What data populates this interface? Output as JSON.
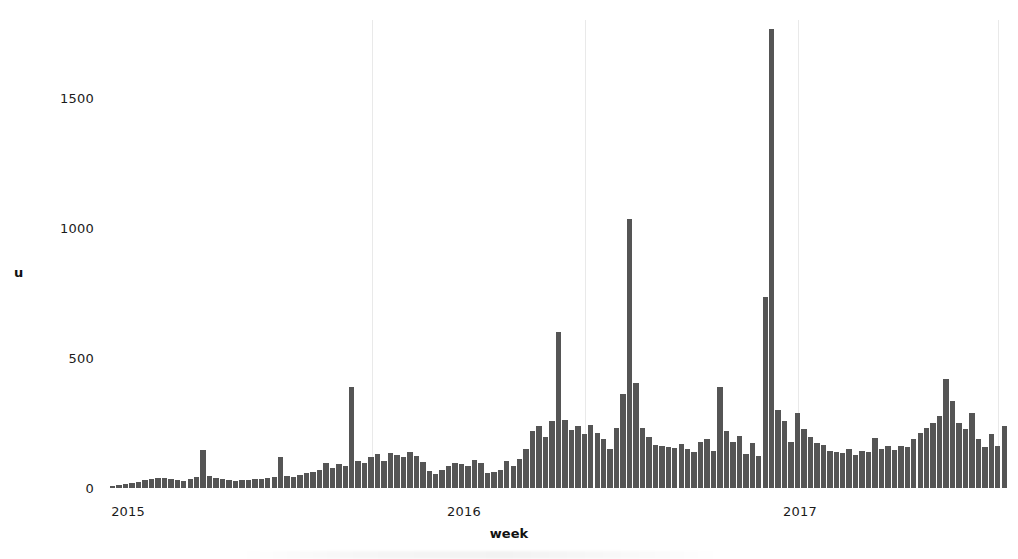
{
  "chart_data": {
    "type": "bar",
    "title": "",
    "xlabel": "week",
    "ylabel": "u",
    "ylim": [
      0,
      1800
    ],
    "grid": "vertical-only",
    "legend": "none",
    "bar_color": "#555555",
    "gridline_color": "#e9e9e9",
    "y_ticks": [
      0,
      500,
      1000,
      1500
    ],
    "y_tick_labels": [
      "0",
      "500",
      "1000",
      "1500"
    ],
    "x_tick_labels": [
      "2015",
      "2016",
      "2017"
    ],
    "x_tick_positions_week_index": [
      2,
      54,
      106
    ],
    "gridline_week_indices": [
      40,
      73,
      106,
      137
    ],
    "categories_note": "weekly observations from early 2015 through late 2017",
    "values": [
      8,
      10,
      14,
      18,
      22,
      30,
      34,
      38,
      40,
      36,
      30,
      28,
      34,
      44,
      145,
      48,
      38,
      34,
      30,
      28,
      32,
      30,
      34,
      36,
      38,
      42,
      118,
      46,
      44,
      50,
      56,
      62,
      70,
      96,
      78,
      92,
      86,
      390,
      104,
      96,
      120,
      130,
      104,
      136,
      126,
      118,
      138,
      122,
      100,
      66,
      54,
      70,
      86,
      96,
      94,
      84,
      108,
      96,
      56,
      60,
      68,
      104,
      86,
      112,
      150,
      218,
      240,
      196,
      258,
      600,
      262,
      222,
      238,
      206,
      242,
      212,
      188,
      150,
      232,
      360,
      1035,
      404,
      230,
      196,
      166,
      160,
      156,
      152,
      168,
      150,
      138,
      176,
      190,
      144,
      390,
      220,
      176,
      200,
      130,
      172,
      124,
      736,
      1765,
      300,
      256,
      176,
      290,
      226,
      196,
      174,
      166,
      142,
      140,
      136,
      150,
      128,
      142,
      138,
      192,
      150,
      160,
      146,
      160,
      158,
      188,
      210,
      232,
      250,
      276,
      418,
      334,
      250,
      228,
      288,
      190,
      158,
      208,
      160,
      238
    ]
  },
  "figure": {
    "background": "#ffffff",
    "plot_left_px": 110,
    "plot_top_px": 20,
    "plot_width_px": 898,
    "plot_height_px": 468
  },
  "axes": {
    "y_title": "u",
    "x_title": "week"
  }
}
